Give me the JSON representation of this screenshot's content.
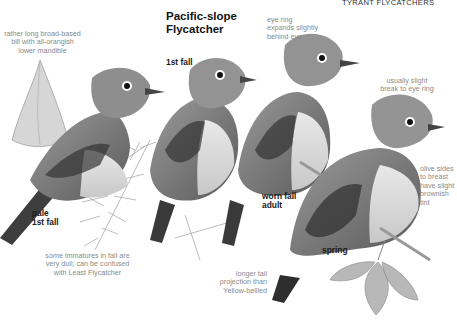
{
  "page": {
    "section_header": "TYRANT FLYCATCHERS",
    "species_title_line1": "Pacific-slope",
    "species_title_line2": "Flycatcher"
  },
  "plumage_labels": {
    "pale_1st_fall_line1": "pale",
    "pale_1st_fall_line2": "1st fall",
    "first_fall": "1st fall",
    "worn_fall_adult_line1": "worn fall",
    "worn_fall_adult_line2": "adult",
    "spring": "spring"
  },
  "annotations": {
    "bill_line1": "rather long broad-based",
    "bill_line2": "bill with all-orangish",
    "bill_line3": "lower mandible",
    "eye_ring_line1": "eye ring",
    "eye_ring_line2": "expands slightly",
    "eye_ring_line3": "behind eye",
    "break_line1": "usually slight",
    "break_line2": "break to eye ring",
    "olive_line1": "olive sides",
    "olive_line2": "to breast",
    "olive_line3": "have slight",
    "olive_line4": "brownish",
    "olive_line5": "tint",
    "immatures_line1": "some immatures in fall are",
    "immatures_line2": "very dull; can be confused",
    "immatures_line3": "with Least Flycatcher",
    "tail_line1": "longer tail",
    "tail_line2": "projection than",
    "tail_line3": "Yellow-bellied"
  },
  "colors": {
    "background": "#ffffff",
    "annotation_text": "#8a8a8a",
    "label_text": "#1a1a1a"
  }
}
